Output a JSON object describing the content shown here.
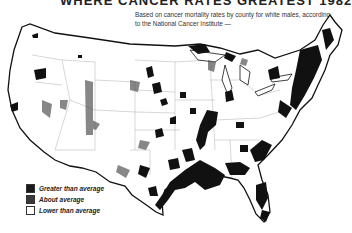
{
  "title": "WHERE CANCER RATES GREATEST 1982",
  "subtitle": "Based on cancer mortality rates by county for white males, according to the National Cancer Institute —",
  "legend": {
    "items": [
      {
        "label": "Greater than average",
        "color": "#1a1a1a"
      },
      {
        "label": "About average",
        "color": "#3a3a3a"
      },
      {
        "label": "Lower than average",
        "color": "#ffffff"
      }
    ]
  },
  "map": {
    "region": "Contiguous United States",
    "unit": "county",
    "metric": "cancer mortality rate, white males"
  }
}
